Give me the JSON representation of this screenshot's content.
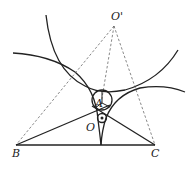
{
  "figure": {
    "type": "geometry-diagram",
    "labels": {
      "O_prime": "O'",
      "A": "A",
      "O": "O",
      "B": "B",
      "C": "C"
    },
    "points": {
      "O_prime": [
        114,
        26
      ],
      "A": [
        101,
        106
      ],
      "O": [
        102,
        118
      ],
      "B": [
        16,
        145
      ],
      "C": [
        155,
        145
      ]
    },
    "colors": {
      "stroke": "#222222",
      "dashed": "#555555",
      "background": "#ffffff"
    }
  }
}
